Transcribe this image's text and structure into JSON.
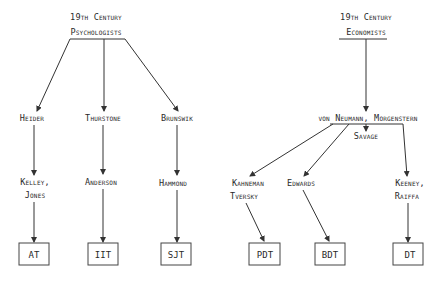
{
  "left_tree": {
    "root": {
      "line1": "19th Century",
      "line2": "Psychologists"
    },
    "branches": [
      {
        "name": "Heider",
        "next": [
          "Kelley,",
          "Jones"
        ],
        "leaf": "AT"
      },
      {
        "name": "Thurstone",
        "next": [
          "Anderson"
        ],
        "leaf": "IIT"
      },
      {
        "name": "Brunswik",
        "next": [
          "Hammond"
        ],
        "leaf": "SJT"
      }
    ]
  },
  "right_tree": {
    "root": {
      "line1": "19th Century",
      "line2": "Economists"
    },
    "middle": "von Neumann, Morgenstern",
    "middle_sub": "Savage",
    "branches": [
      {
        "name": [
          "Kahneman",
          "Tversky"
        ],
        "leaf": "PDT"
      },
      {
        "name": [
          "Edwards"
        ],
        "leaf": "BDT"
      },
      {
        "name": [
          "Keeney,",
          "Raiffa"
        ],
        "leaf": "DT"
      }
    ]
  }
}
